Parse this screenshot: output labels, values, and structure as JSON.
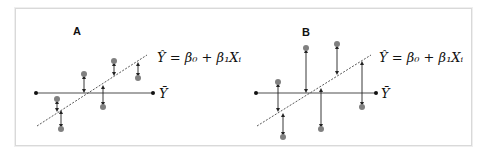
{
  "figure": {
    "panels": [
      {
        "label": "A",
        "equation": "Ŷ = β₀ + β₁Xᵢ",
        "mean_label": "Ȳ",
        "description": "Small deviations of observed points from regression line"
      },
      {
        "label": "B",
        "equation": "Ŷ = β₀ + β₁Xᵢ",
        "mean_label": "Ȳ",
        "description": "Large deviations of observed points from regression line"
      }
    ],
    "colors": {
      "point": "#808080",
      "mean_line": "#888888",
      "regression_line": "#444444",
      "residual_arrow": "#222222",
      "frame_border": "#d9d9d9"
    }
  }
}
